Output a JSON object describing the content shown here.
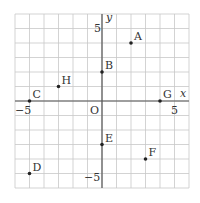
{
  "axes": {
    "x_label": "x",
    "y_label": "y",
    "origin_label": "O",
    "x_range": [
      -6,
      6
    ],
    "y_range": [
      -6,
      6
    ],
    "tick_labels": {
      "x_neg": "−5",
      "x_pos": "5",
      "y_pos": "5",
      "y_neg": "−5"
    }
  },
  "points": [
    {
      "name": "A",
      "x": 2,
      "y": 4
    },
    {
      "name": "B",
      "x": 0,
      "y": 2
    },
    {
      "name": "C",
      "x": -5,
      "y": 0
    },
    {
      "name": "D",
      "x": -5,
      "y": -5
    },
    {
      "name": "E",
      "x": 0,
      "y": -3
    },
    {
      "name": "F",
      "x": 3,
      "y": -4
    },
    {
      "name": "G",
      "x": 4,
      "y": 0
    },
    {
      "name": "H",
      "x": -3,
      "y": 1
    }
  ],
  "colors": {
    "grid": "#c8c8c8",
    "axis": "#555555",
    "point": "#222222"
  }
}
